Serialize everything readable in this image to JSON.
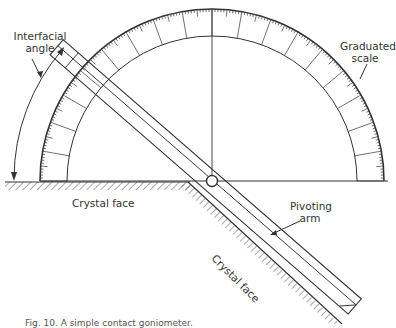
{
  "figure": {
    "type": "diagram",
    "labels": {
      "interfacial_angle_line1": "Interfacial",
      "interfacial_angle_line2": "angle",
      "graduated_scale_line1": "Graduated",
      "graduated_scale_line2": "scale",
      "crystal_face_horizontal": "Crystal face",
      "crystal_face_inclined": "Crystal face",
      "pivoting_arm_line1": "Pivoting",
      "pivoting_arm_line2": "arm"
    },
    "caption": "Fig. 10. A simple contact goniometer."
  },
  "geometry": {
    "pivot": [
      212,
      181
    ],
    "outer_radius": 172,
    "inner_radius": 145,
    "arm_angle_deg": 41,
    "colors": {
      "stroke": "#333333",
      "background": "#ffffff"
    }
  }
}
